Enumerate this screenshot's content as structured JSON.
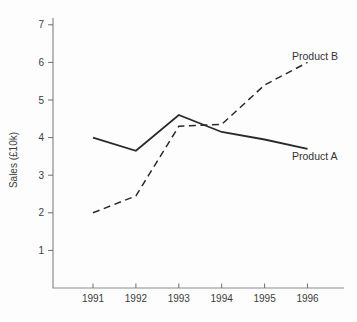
{
  "chart_data": {
    "type": "line",
    "ylabel": "Sales (£10k)",
    "categories": [
      "1991",
      "1992",
      "1993",
      "1994",
      "1995",
      "1996"
    ],
    "y_ticks": [
      1,
      2,
      3,
      4,
      5,
      6,
      7
    ],
    "ylim": [
      0,
      7.2
    ],
    "grid": false,
    "legend_position": "end-of-line labels",
    "colors": {
      "line": "#2a2a2a",
      "axis": "#8b8b8b",
      "tick": "#6e6e6e",
      "text": "#3c3c3c"
    },
    "series": [
      {
        "name": "Product A",
        "style": "solid",
        "color": "#2a2a2a",
        "values": [
          4.0,
          3.65,
          4.6,
          4.15,
          3.95,
          3.7
        ]
      },
      {
        "name": "Product B",
        "style": "dashed",
        "color": "#2a2a2a",
        "values": [
          2.0,
          2.45,
          4.3,
          4.35,
          5.4,
          6.0
        ]
      }
    ]
  }
}
